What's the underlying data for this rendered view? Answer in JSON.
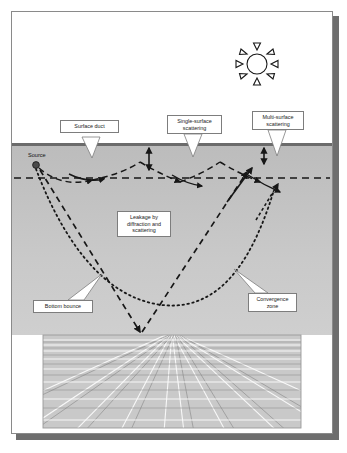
{
  "figure": {
    "type": "diagram",
    "sun_icon": "sun-icon",
    "source_label": "Source",
    "callouts": [
      {
        "id": "surface-duct",
        "text": "Surface duct"
      },
      {
        "id": "single-surface-scattering",
        "text": "Single-surface\nscattering"
      },
      {
        "id": "multi-surface-scattering",
        "text": "Multi-surface\nscattering"
      },
      {
        "id": "leakage",
        "text": "Leakage by\ndiffraction and\nscattering"
      },
      {
        "id": "bottom-bounce",
        "text": "Bottom bounce"
      },
      {
        "id": "convergence-zone",
        "text": "Convergence\nzone"
      }
    ],
    "colors": {
      "frame_border": "#8a8a8a",
      "shadow": "#6e6e6e",
      "sky": "#ffffff",
      "water_top": "#bcbcbc",
      "water_bottom": "#cfcfcf",
      "sea_surface_line": "#6b6b6b",
      "ray": "#171717",
      "seafloor_grid": "#ffffff",
      "label_border": "#7d7d7d"
    }
  }
}
